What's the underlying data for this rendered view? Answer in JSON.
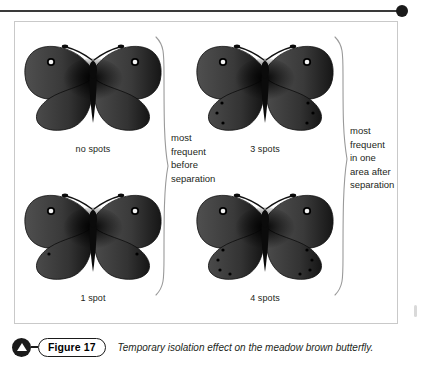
{
  "figure": {
    "rule_accent_color": "#1a1a1a",
    "frame_border_color": "#c9c9c9",
    "specimens": [
      {
        "label": "no spots",
        "spots_per_hindwing": 0
      },
      {
        "label": "3 spots",
        "spots_per_hindwing": 3
      },
      {
        "label": "1 spot",
        "spots_per_hindwing": 1
      },
      {
        "label": "4 spots",
        "spots_per_hindwing": 4
      }
    ],
    "brackets": {
      "left": {
        "text": "most\nfrequent\nbefore\nseparation"
      },
      "right": {
        "text": "most\nfrequent\nin one\narea after\nseparation"
      }
    }
  },
  "caption": {
    "badge_icon": "triangle-up-icon",
    "number_label": "Figure 17",
    "text": "Temporary isolation effect on the meadow brown butterfly."
  }
}
